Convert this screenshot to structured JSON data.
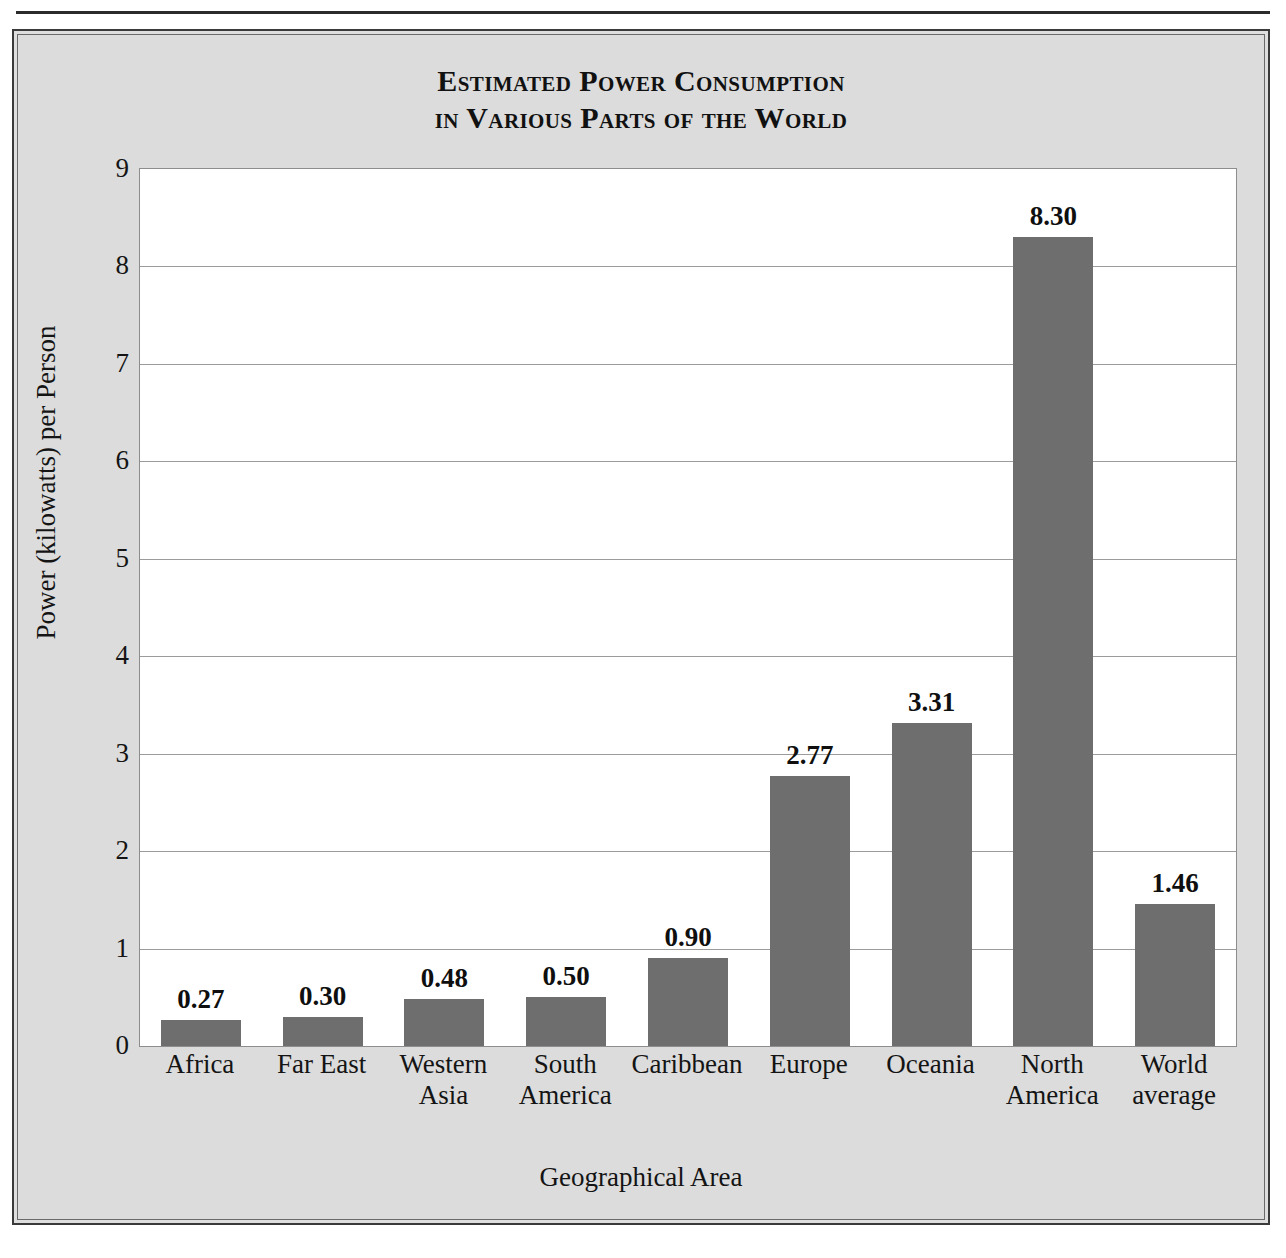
{
  "figure": {
    "background_color": "#dcdcdc",
    "frame_color": "#3a3a3a"
  },
  "title": {
    "line1": "Estimated Power Consumption",
    "line2": "in Various Parts of the World"
  },
  "chart_data": {
    "type": "bar",
    "title": "Estimated Power Consumption in Various Parts of the World",
    "xlabel": "Geographical Area",
    "ylabel": "Power (kilowatts) per Person",
    "ylim": [
      0,
      9
    ],
    "yticks": [
      "0",
      "1",
      "2",
      "3",
      "4",
      "5",
      "6",
      "7",
      "8",
      "9"
    ],
    "grid": "horizontal",
    "legend": "none",
    "bar_color": "#6e6e6e",
    "categories": [
      "Africa",
      "Far East",
      "Western Asia",
      "South America",
      "Caribbean",
      "Europe",
      "Oceania",
      "North America",
      "World average"
    ],
    "category_lines": [
      [
        "Africa"
      ],
      [
        "Far East"
      ],
      [
        "Western",
        "Asia"
      ],
      [
        "South",
        "America"
      ],
      [
        "Caribbean"
      ],
      [
        "Europe"
      ],
      [
        "Oceania"
      ],
      [
        "North",
        "America"
      ],
      [
        "World",
        "average"
      ]
    ],
    "values": [
      0.27,
      0.3,
      0.48,
      0.5,
      0.9,
      2.77,
      3.31,
      8.3,
      1.46
    ],
    "value_labels": [
      "0.27",
      "0.30",
      "0.48",
      "0.50",
      "0.90",
      "2.77",
      "3.31",
      "8.30",
      "1.46"
    ]
  }
}
